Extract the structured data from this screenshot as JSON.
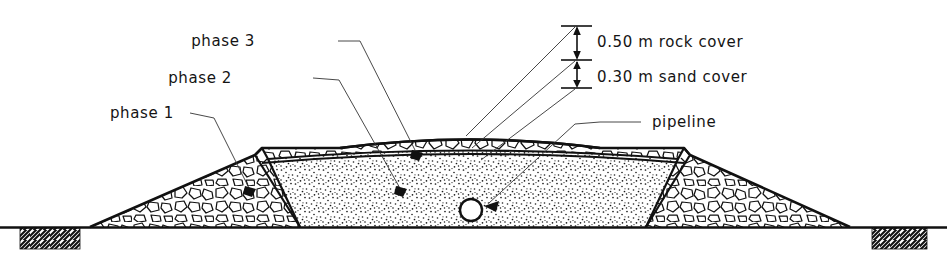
{
  "figure": {
    "line_color": "#111111",
    "fill_color": "#ffffff",
    "background": "#ffffff"
  },
  "labels": {
    "phase1": "phase 1",
    "phase2": "phase 2",
    "phase3": "phase 3",
    "pipeline": "pipeline",
    "rock_cover": "0.50 m rock cover",
    "sand_cover": "0.30 m sand cover"
  },
  "dimensions": {
    "rock_cover_value": "0.50",
    "rock_cover_unit": "m",
    "rock_cover_name": "rock cover",
    "sand_cover_value": "0.30",
    "sand_cover_unit": "m",
    "sand_cover_name": "sand cover"
  },
  "geometry": {
    "ground_line_y": 227,
    "crest_y": 140,
    "left_toe_x": 90,
    "right_toe_x": 850,
    "centre_x": 471,
    "pipeline_centre_x": 471,
    "pipeline_centre_y": 210,
    "pipeline_radius": 11,
    "phase1_notch_x": 255,
    "phase3_notch_x": 690,
    "notch_y": 155,
    "dimension_line_x": 577,
    "dim_top_y": 26,
    "dim_mid_y": 60,
    "dim_bot_y": 88
  },
  "materials": {
    "rock_fill": "rock-fill-hatch",
    "sand_fill": "sand-stipple-hatch",
    "ground": "ground-cross-hatch"
  }
}
